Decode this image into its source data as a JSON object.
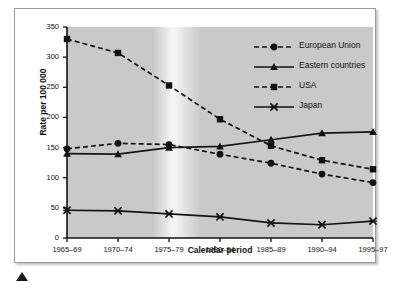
{
  "chart_data": {
    "type": "line",
    "title": "",
    "xlabel": "Calendar period",
    "ylabel": "Rate per 100 000",
    "categories": [
      "1965–69",
      "1970–74",
      "1975–79",
      "1980–84",
      "1985–89",
      "1990–94",
      "1995–97"
    ],
    "ylim": [
      0,
      350
    ],
    "yticks": [
      0,
      50,
      100,
      150,
      200,
      250,
      300,
      350
    ],
    "grid": false,
    "legend_position": "top-right",
    "series": [
      {
        "name": "European Union",
        "marker": "circle",
        "line": "dashed",
        "color": "#141414",
        "values": [
          148,
          157,
          155,
          139,
          124,
          106,
          92
        ]
      },
      {
        "name": "Eastern countries",
        "marker": "triangle",
        "line": "solid",
        "color": "#141414",
        "values": [
          140,
          139,
          150,
          152,
          163,
          174,
          176
        ]
      },
      {
        "name": "USA",
        "marker": "square",
        "line": "dashed",
        "color": "#141414",
        "values": [
          330,
          307,
          253,
          197,
          153,
          129,
          114
        ]
      },
      {
        "name": "Japan",
        "marker": "x",
        "line": "solid",
        "color": "#141414",
        "values": [
          46,
          45,
          40,
          35,
          25,
          22,
          28
        ]
      }
    ]
  },
  "figure": {
    "caret_icon": "up-triangle-marker",
    "plot_background": "#c9c9c9",
    "frame_border": "#9a9a9a"
  }
}
